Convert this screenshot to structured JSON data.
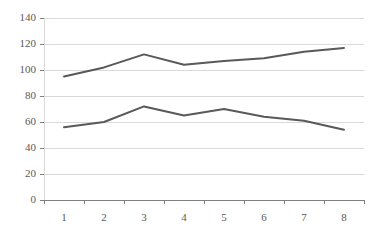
{
  "chart_data": {
    "type": "line",
    "title": "",
    "subtitle": "",
    "xlabel": "",
    "ylabel": "",
    "categories": [
      "1",
      "2",
      "3",
      "4",
      "5",
      "6",
      "7",
      "8"
    ],
    "series": [
      {
        "name": "Series 1",
        "values": [
          95,
          102,
          112,
          104,
          107,
          109,
          114,
          117
        ],
        "color": "#595959"
      },
      {
        "name": "Series 2",
        "values": [
          56,
          60,
          72,
          65,
          70,
          64,
          61,
          54
        ],
        "color": "#595959"
      }
    ],
    "ylim": [
      0,
      140
    ],
    "ytick_step": 20,
    "ytick_labels": [
      "0",
      "20",
      "40",
      "60",
      "80",
      "100",
      "120",
      "140"
    ],
    "xtick_labels": [
      "1",
      "2",
      "3",
      "4",
      "5",
      "6",
      "7",
      "8"
    ],
    "grid": true,
    "grid_axis": "y",
    "grid_color": "#d9d9d9",
    "axis_color": "#808080",
    "legend": false,
    "legend_position": "none",
    "markers": false,
    "background": "#ffffff"
  }
}
